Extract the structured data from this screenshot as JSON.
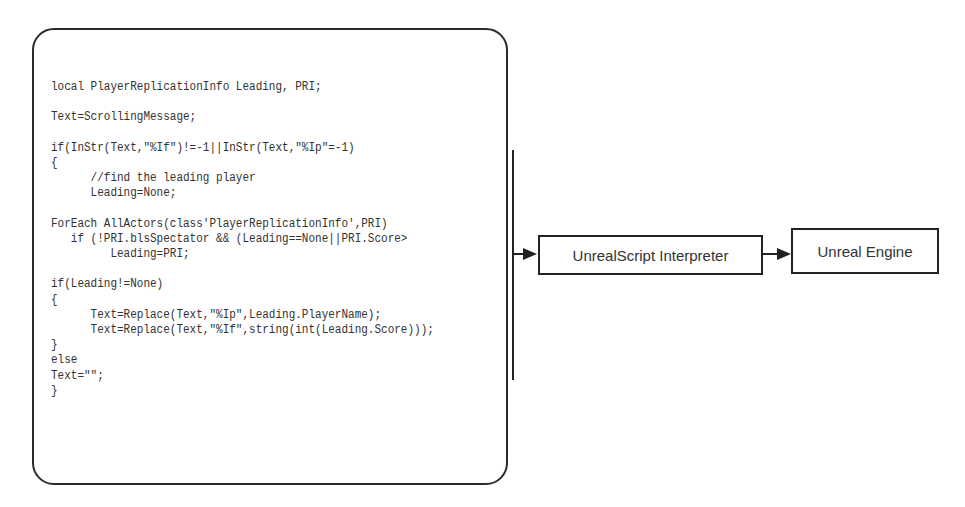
{
  "code_block": {
    "lines": [
      "local PlayerReplicationInfo Leading, PRI;",
      "",
      "Text=ScrollingMessage;",
      "",
      "if(InStr(Text,\"%If\")!=-1||InStr(Text,\"%Ip\"=-1)",
      "{",
      "      //find the leading player",
      "      Leading=None;",
      "",
      "ForEach AllActors(class'PlayerReplicationInfo',PRI)",
      "   if (!PRI.blsSpectator && (Leading==None||PRI.Score>",
      "         Leading=PRI;",
      "",
      "if(Leading!=None)",
      "{",
      "      Text=Replace(Text,\"%Ip\",Leading.PlayerName);",
      "      Text=Replace(Text,\"%If\",string(int(Leading.Score)));",
      "}",
      "else",
      "Text=\"\";",
      "}"
    ]
  },
  "flow": {
    "interpreter_label": "UnrealScript Interpreter",
    "engine_label": "Unreal Engine"
  }
}
